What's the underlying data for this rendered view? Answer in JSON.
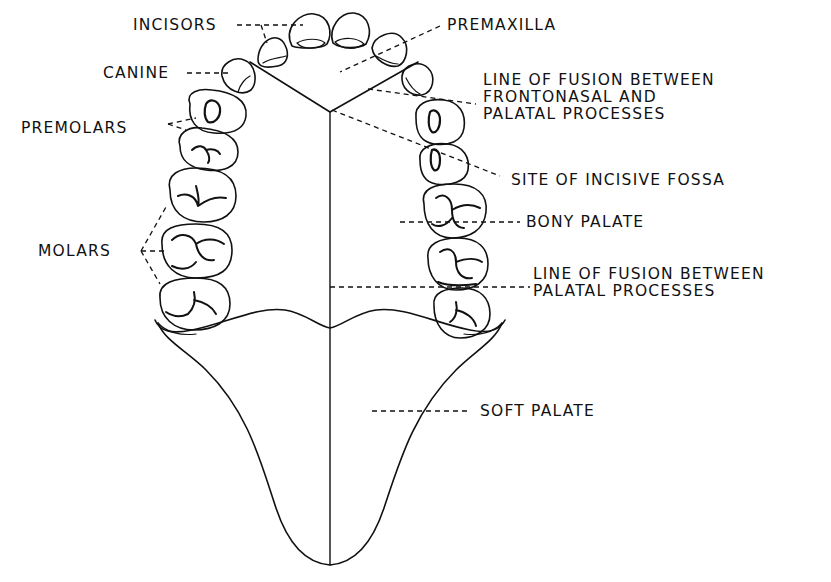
{
  "diagram": {
    "colors": {
      "ink": "#111111",
      "paper": "#ffffff"
    },
    "labels": {
      "incisors": "INCISORS",
      "canine": "CANINE",
      "premolars": "PREMOLARS",
      "molars": "MOLARS",
      "premaxilla": "PREMAXILLA",
      "fusion_frontonasal": [
        "LINE OF FUSION BETWEEN",
        "FRONTONASAL AND",
        "PALATAL PROCESSES"
      ],
      "incisive_fossa": "SITE OF INCISIVE FOSSA",
      "bony_palate": "BONY PALATE",
      "fusion_palatal": [
        "LINE OF FUSION BETWEEN",
        "PALATAL PROCESSES"
      ],
      "soft_palate": "SOFT PALATE"
    }
  }
}
